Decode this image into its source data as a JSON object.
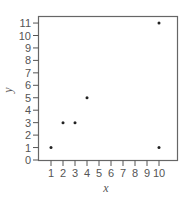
{
  "chart_data": {
    "type": "scatter",
    "title": "",
    "xlabel": "x",
    "ylabel": "y",
    "x": [
      1,
      2,
      3,
      4,
      10,
      10
    ],
    "y": [
      1,
      3,
      3,
      5,
      11,
      1
    ],
    "points": [
      {
        "x": 1,
        "y": 1
      },
      {
        "x": 2,
        "y": 3
      },
      {
        "x": 3,
        "y": 3
      },
      {
        "x": 4,
        "y": 5
      },
      {
        "x": 10,
        "y": 11
      },
      {
        "x": 10,
        "y": 1
      }
    ],
    "xticks": [
      1,
      2,
      3,
      4,
      5,
      6,
      7,
      8,
      9,
      10
    ],
    "yticks": [
      0,
      1,
      2,
      3,
      4,
      5,
      6,
      7,
      8,
      9,
      10,
      11
    ],
    "xlim": [
      0,
      10.5
    ],
    "ylim": [
      0,
      11.5
    ],
    "grid": false,
    "legend": null
  },
  "style": {
    "axis_color": "#555555",
    "point_color": "#222222"
  }
}
